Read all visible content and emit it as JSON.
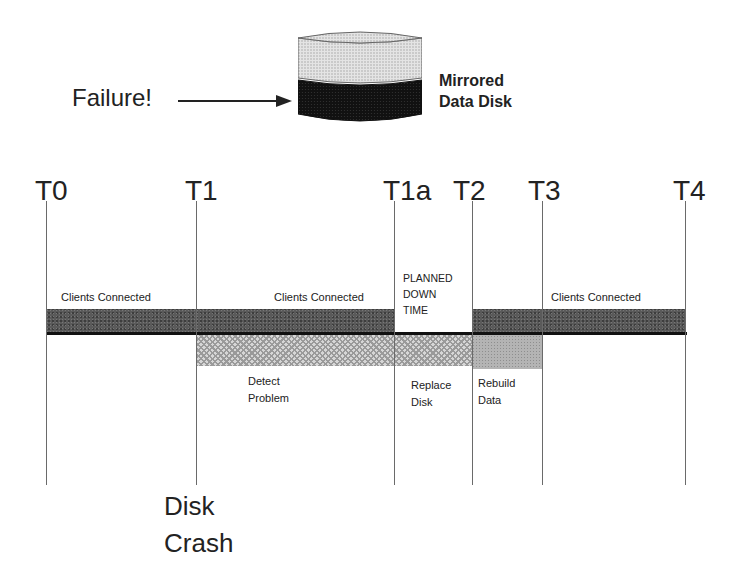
{
  "header": {
    "failure_label": "Failure!",
    "disk_label_line1": "Mirrored",
    "disk_label_line2": "Data Disk",
    "icons": {
      "arrow": "right-arrow-icon",
      "disk": "mirrored-disk-icon"
    }
  },
  "timeline": {
    "markers": [
      {
        "label": "T0",
        "x": 46
      },
      {
        "label": "T1",
        "x": 196
      },
      {
        "label": "T1a",
        "x": 394
      },
      {
        "label": "T2",
        "x": 472
      },
      {
        "label": "T3",
        "x": 542
      },
      {
        "label": "T4",
        "x": 685
      }
    ],
    "segments": {
      "clients_connected_1": "Clients Connected",
      "clients_connected_2": "Clients Connected",
      "clients_connected_3": "Clients Connected",
      "planned_downtime": [
        "PLANNED",
        "DOWN",
        "TIME"
      ],
      "detect_problem": [
        "Detect",
        "Problem"
      ],
      "replace_disk": [
        "Replace",
        "Disk"
      ],
      "rebuild_data": [
        "Rebuild",
        "Data"
      ]
    },
    "event_label": [
      "Disk",
      "Crash"
    ],
    "colors": {
      "connected_bar": "#5a5a5a",
      "hatch_bar": "#d6d6d6",
      "rebuild_bar": "#b4b4b4",
      "baseline": "#111111"
    }
  }
}
